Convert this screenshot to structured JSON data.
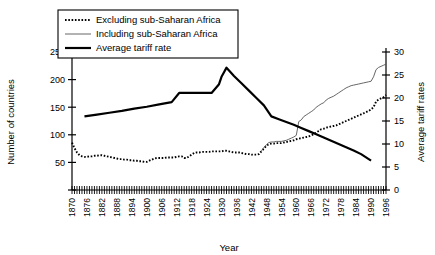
{
  "chart_data": {
    "type": "line",
    "title": "",
    "xlabel": "Year",
    "ylabel": "Number of countries",
    "y2label": "Average tariff rates",
    "xlim": [
      1870,
      1996
    ],
    "ylim": [
      0,
      250
    ],
    "y2lim": [
      0,
      30
    ],
    "grid": false,
    "legend_position": "top-left",
    "y_ticks": [
      0,
      50,
      100,
      150,
      200,
      250
    ],
    "y2_ticks": [
      0,
      5,
      10,
      15,
      20,
      25,
      30
    ],
    "x_ticks": [
      1870,
      1876,
      1882,
      1888,
      1894,
      1900,
      1906,
      1912,
      1918,
      1924,
      1930,
      1936,
      1942,
      1948,
      1954,
      1960,
      1966,
      1972,
      1978,
      1984,
      1990,
      1996
    ],
    "x_minor_tick_interval": 1,
    "series": [
      {
        "name": "Excluding sub-Saharan Africa",
        "axis": "left",
        "style": "dotted",
        "color": "#000000",
        "x": [
          1870,
          1871,
          1872,
          1873,
          1874,
          1875,
          1876,
          1877,
          1878,
          1879,
          1880,
          1881,
          1882,
          1883,
          1884,
          1885,
          1886,
          1887,
          1888,
          1889,
          1890,
          1891,
          1892,
          1893,
          1894,
          1895,
          1896,
          1897,
          1898,
          1899,
          1900,
          1901,
          1902,
          1903,
          1904,
          1905,
          1906,
          1907,
          1908,
          1909,
          1910,
          1911,
          1912,
          1913,
          1914,
          1915,
          1916,
          1917,
          1918,
          1919,
          1920,
          1921,
          1922,
          1923,
          1924,
          1925,
          1926,
          1927,
          1928,
          1929,
          1930,
          1931,
          1932,
          1933,
          1934,
          1935,
          1936,
          1937,
          1938,
          1939,
          1940,
          1941,
          1942,
          1943,
          1944,
          1945,
          1946,
          1947,
          1948,
          1949,
          1950,
          1951,
          1952,
          1953,
          1954,
          1955,
          1956,
          1957,
          1958,
          1959,
          1960,
          1961,
          1962,
          1963,
          1964,
          1965,
          1966,
          1967,
          1968,
          1969,
          1970,
          1971,
          1972,
          1973,
          1974,
          1975,
          1976,
          1977,
          1978,
          1979,
          1980,
          1981,
          1982,
          1983,
          1984,
          1985,
          1986,
          1987,
          1988,
          1989,
          1990,
          1991,
          1992,
          1993,
          1994,
          1995,
          1996
        ],
        "values": [
          86,
          76,
          68,
          63,
          61,
          60,
          60,
          61,
          61,
          62,
          62,
          63,
          63,
          62,
          61,
          60,
          59,
          58,
          57,
          56,
          56,
          55,
          55,
          54,
          54,
          53,
          53,
          52,
          52,
          51,
          51,
          53,
          55,
          57,
          58,
          58,
          58,
          58,
          59,
          59,
          59,
          59,
          60,
          61,
          61,
          58,
          58,
          61,
          64,
          67,
          68,
          68,
          69,
          69,
          69,
          69,
          70,
          70,
          70,
          70,
          70,
          71,
          71,
          70,
          69,
          68,
          68,
          68,
          67,
          66,
          65,
          65,
          64,
          64,
          64,
          65,
          70,
          75,
          80,
          83,
          84,
          84,
          85,
          85,
          85,
          86,
          87,
          88,
          89,
          90,
          92,
          93,
          94,
          95,
          96,
          97,
          99,
          101,
          104,
          107,
          110,
          111,
          113,
          114,
          115,
          116,
          117,
          119,
          121,
          123,
          125,
          127,
          129,
          131,
          133,
          135,
          137,
          139,
          141,
          143,
          146,
          150,
          160,
          164,
          166,
          168,
          172
        ]
      },
      {
        "name": "Including sub-Saharan Africa",
        "axis": "left",
        "style": "thin-solid",
        "color": "#555555",
        "x": [
          1946,
          1947,
          1948,
          1949,
          1950,
          1951,
          1952,
          1953,
          1954,
          1955,
          1956,
          1957,
          1958,
          1959,
          1960,
          1961,
          1962,
          1963,
          1964,
          1965,
          1966,
          1967,
          1968,
          1969,
          1970,
          1971,
          1972,
          1973,
          1974,
          1975,
          1976,
          1977,
          1978,
          1979,
          1980,
          1981,
          1982,
          1983,
          1984,
          1985,
          1986,
          1987,
          1988,
          1989,
          1990,
          1991,
          1992,
          1993,
          1994,
          1995,
          1996
        ],
        "values": [
          71,
          77,
          82,
          86,
          87,
          87,
          88,
          88,
          88,
          89,
          90,
          92,
          94,
          96,
          99,
          124,
          127,
          133,
          136,
          139,
          142,
          145,
          150,
          153,
          156,
          158,
          163,
          166,
          168,
          170,
          173,
          176,
          179,
          182,
          185,
          187,
          189,
          190,
          191,
          192,
          193,
          194,
          195,
          196,
          197,
          205,
          218,
          222,
          224,
          226,
          228
        ]
      },
      {
        "name": "Average tariff rate",
        "axis": "right",
        "style": "thick-solid",
        "color": "#000000",
        "x": [
          1875,
          1880,
          1885,
          1890,
          1895,
          1900,
          1905,
          1910,
          1913,
          1918,
          1921,
          1925,
          1926,
          1929,
          1930,
          1931,
          1932,
          1935,
          1938,
          1941,
          1944,
          1947,
          1950,
          1953,
          1956,
          1959,
          1962,
          1965,
          1968,
          1971,
          1974,
          1977,
          1980,
          1983,
          1986,
          1990
        ],
        "values": [
          16.0,
          16.4,
          16.8,
          17.2,
          17.7,
          18.1,
          18.6,
          19.1,
          21.1,
          21.1,
          21.1,
          21.1,
          21.1,
          23.0,
          24.6,
          25.6,
          26.6,
          24.8,
          23.2,
          21.6,
          20.0,
          18.4,
          16.0,
          15.4,
          14.8,
          14.2,
          13.5,
          12.8,
          12.1,
          11.4,
          10.7,
          10.0,
          9.3,
          8.6,
          7.8,
          6.4
        ]
      }
    ]
  },
  "legend": {
    "items": [
      {
        "label": "Excluding sub-Saharan Africa",
        "swatch": "dotted"
      },
      {
        "label": "Including sub-Saharan Africa",
        "swatch": "thin-solid"
      },
      {
        "label": "Average tariff rate",
        "swatch": "thick-solid"
      }
    ]
  },
  "axes": {
    "left_title": "Number of countries",
    "right_title": "Average tariff rates",
    "bottom_title": "Year"
  }
}
